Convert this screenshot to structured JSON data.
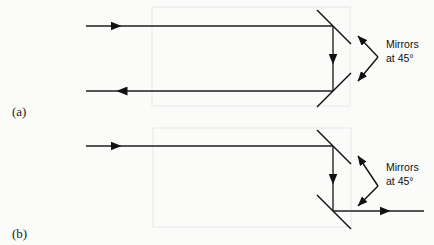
{
  "figure": {
    "background_color": "#fbfbfa",
    "beam_color": "#555555",
    "mirror_color": "#111111",
    "box_color": "#e9e9e9",
    "panels": [
      {
        "id": "a",
        "label": "(a)",
        "callout": {
          "line1": "Mirrors",
          "line2": "at 45°"
        },
        "enclosure": {
          "x": 152,
          "y": 7,
          "width": 198,
          "height": 99
        },
        "beams": [
          {
            "name": "input-beam",
            "direction": "right",
            "y": 26,
            "from_x": 86,
            "to_x": 333
          },
          {
            "name": "vertical-beam",
            "direction": "down",
            "x": 333,
            "from_y": 26,
            "to_y": 91
          },
          {
            "name": "output-beam",
            "direction": "left",
            "y": 91,
            "from_x": 333,
            "to_x": 86
          }
        ],
        "mirrors": [
          {
            "name": "upper-mirror",
            "angle_deg": 45,
            "orientation": "down-right"
          },
          {
            "name": "lower-mirror",
            "angle_deg": 45,
            "orientation": "up-right"
          }
        ]
      },
      {
        "id": "b",
        "label": "(b)",
        "callout": {
          "line1": "Mirrors",
          "line2": "at 45°"
        },
        "enclosure": {
          "x": 153,
          "y": 128,
          "width": 198,
          "height": 99
        },
        "beams": [
          {
            "name": "input-beam",
            "direction": "right",
            "y": 146,
            "from_x": 86,
            "to_x": 333
          },
          {
            "name": "vertical-beam",
            "direction": "down",
            "x": 333,
            "from_y": 146,
            "to_y": 211
          },
          {
            "name": "output-beam",
            "direction": "right",
            "y": 211,
            "from_x": 333,
            "to_x": 424
          }
        ],
        "mirrors": [
          {
            "name": "upper-mirror",
            "angle_deg": 45,
            "orientation": "down-right"
          },
          {
            "name": "lower-mirror",
            "angle_deg": 45,
            "orientation": "down-right"
          }
        ]
      }
    ]
  }
}
